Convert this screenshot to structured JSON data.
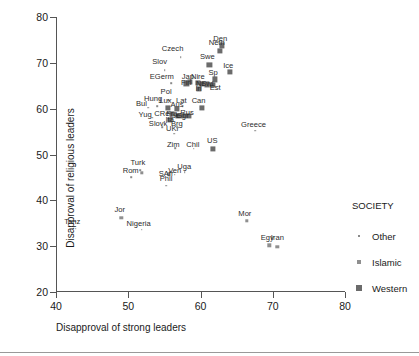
{
  "chart_data": {
    "type": "scatter",
    "title": "",
    "xlabel": "Disapproval of strong leaders",
    "ylabel": "Disapproval of religious leaders",
    "xlim": [
      40,
      80
    ],
    "ylim": [
      20,
      80
    ],
    "xticks": [
      40,
      50,
      60,
      70,
      80
    ],
    "yticks": [
      20,
      30,
      40,
      50,
      60,
      70,
      80
    ],
    "grid": false,
    "legend": {
      "title": "SOCIETY",
      "position": "right",
      "entries": [
        {
          "label": "Other",
          "marker": "tiny-dot",
          "color": "#8a8a8a"
        },
        {
          "label": "Islamic",
          "marker": "small-square",
          "color": "#8f8f8f"
        },
        {
          "label": "Western",
          "marker": "large-square",
          "color": "#6b6b6b"
        }
      ]
    },
    "series": [
      {
        "name": "Other",
        "marker": "tiny-dot",
        "points": [
          {
            "label": "Czech",
            "x": 57.1,
            "y": 71.2,
            "lx": 56.0,
            "ly": 73.0
          },
          {
            "label": "Slov",
            "x": 54.9,
            "y": 68.4,
            "lx": 54.2,
            "ly": 70.1
          },
          {
            "label": "EGerm",
            "x": 55.8,
            "y": 65.6,
            "lx": 54.5,
            "ly": 67.0
          },
          {
            "label": "Pol",
            "x": 55.4,
            "y": 61.9,
            "lx": 55.1,
            "ly": 63.6
          },
          {
            "label": "Hung",
            "x": 53.9,
            "y": 60.6,
            "lx": 53.3,
            "ly": 62.1
          },
          {
            "label": "Bul",
            "x": 52.6,
            "y": 60.2,
            "lx": 51.7,
            "ly": 61.0
          },
          {
            "label": "Yug",
            "x": 53.2,
            "y": 58.0,
            "lx": 52.2,
            "ly": 58.6
          },
          {
            "label": "Slovk",
            "x": 54.6,
            "y": 56.0,
            "lx": 54.0,
            "ly": 56.7
          },
          {
            "label": "UKr",
            "x": 56.2,
            "y": 54.5,
            "lx": 56.0,
            "ly": 55.5
          },
          {
            "label": "Brg",
            "x": 56.6,
            "y": 56.0,
            "lx": 56.6,
            "ly": 56.7
          },
          {
            "label": "CRep",
            "x": 55.4,
            "y": 59.1,
            "lx": 54.8,
            "ly": 58.9
          },
          {
            "label": "Zim",
            "x": 56.4,
            "y": 51.4,
            "lx": 56.1,
            "ly": 52.1
          },
          {
            "label": "Chil",
            "x": 58.9,
            "y": 51.3,
            "lx": 58.8,
            "ly": 52.1
          },
          {
            "label": "Greece",
            "x": 67.4,
            "y": 55.2,
            "lx": 67.2,
            "ly": 56.4
          },
          {
            "label": "Turk",
            "x": 51.5,
            "y": 46.6,
            "lx": 51.2,
            "ly": 48.1
          },
          {
            "label": "Rom",
            "x": 50.3,
            "y": 45.0,
            "lx": 50.2,
            "ly": 46.4
          },
          {
            "label": "Phil",
            "x": 55.1,
            "y": 43.2,
            "lx": 55.1,
            "ly": 44.6
          },
          {
            "label": "Ven",
            "x": 56.3,
            "y": 45.6,
            "lx": 56.3,
            "ly": 46.5
          },
          {
            "label": "Uga",
            "x": 57.7,
            "y": 46.1,
            "lx": 57.6,
            "ly": 47.3
          },
          {
            "label": "Nigeria",
            "x": 51.7,
            "y": 33.6,
            "lx": 51.3,
            "ly": 34.9
          },
          {
            "label": "Tanz",
            "x": 42.6,
            "y": 33.8,
            "lx": 42.1,
            "ly": 35.3
          },
          {
            "label": "Lat",
            "x": 57.4,
            "y": 60.4,
            "lx": 57.2,
            "ly": 61.7
          },
          {
            "label": "Can",
            "x": 59.9,
            "y": 60.3,
            "lx": 59.6,
            "ly": 61.6
          },
          {
            "label": "Sp",
            "x": 61.9,
            "y": 66.4,
            "lx": 61.6,
            "ly": 67.7
          }
        ]
      },
      {
        "name": "Islamic",
        "marker": "small-square",
        "points": [
          {
            "label": "Jor",
            "x": 48.9,
            "y": 36.2,
            "lx": 48.7,
            "ly": 37.8
          },
          {
            "label": "Mor",
            "x": 66.3,
            "y": 35.6,
            "lx": 66.0,
            "ly": 37.1
          },
          {
            "label": "Egy",
            "x": 69.4,
            "y": 30.2,
            "lx": 69.1,
            "ly": 31.7
          },
          {
            "label": "Iran",
            "x": 70.5,
            "y": 29.9,
            "lx": 70.5,
            "ly": 31.7
          },
          {
            "label": "SAfr",
            "x": 55.5,
            "y": 45.7,
            "lx": 55.1,
            "ly": 45.8
          },
          {
            "label": "Turk2",
            "x": 51.7,
            "y": 46.0,
            "lx": 51.7,
            "ly": 46.0
          }
        ]
      },
      {
        "name": "Western",
        "marker": "large-square",
        "points": [
          {
            "label": "Den",
            "x": 62.8,
            "y": 73.8,
            "lx": 62.6,
            "ly": 75.2
          },
          {
            "label": "Neth",
            "x": 62.5,
            "y": 72.6,
            "lx": 62.1,
            "ly": 74.3
          },
          {
            "label": "Swe",
            "x": 61.1,
            "y": 69.6,
            "lx": 60.8,
            "ly": 71.3
          },
          {
            "label": "Ice",
            "x": 63.9,
            "y": 68.0,
            "lx": 63.7,
            "ly": 69.4
          },
          {
            "label": "Nire",
            "x": 59.5,
            "y": 65.7,
            "lx": 59.5,
            "ly": 67.0
          },
          {
            "label": "Jap",
            "x": 58.4,
            "y": 65.8,
            "lx": 58.1,
            "ly": 67.0
          },
          {
            "label": "Est",
            "x": 61.5,
            "y": 65.2,
            "lx": 61.9,
            "ly": 64.5
          },
          {
            "label": "Fin",
            "x": 57.9,
            "y": 65.5,
            "lx": 57.9,
            "ly": 65.5
          },
          {
            "label": "Nor",
            "x": 60.1,
            "y": 65.4,
            "lx": 60.1,
            "ly": 65.4
          },
          {
            "label": "Irl",
            "x": 59.6,
            "y": 64.3,
            "lx": 59.6,
            "ly": 64.3
          },
          {
            "label": "Can2",
            "x": 60.1,
            "y": 60.2,
            "lx": 60.1,
            "ly": 60.2
          },
          {
            "label": "Lux",
            "x": 55.4,
            "y": 60.2,
            "lx": 55.0,
            "ly": 61.6
          },
          {
            "label": "Aus",
            "x": 56.6,
            "y": 59.9,
            "lx": 56.6,
            "ly": 60.8
          },
          {
            "label": "Belg",
            "x": 56.7,
            "y": 58.4,
            "lx": 56.8,
            "ly": 58.3
          },
          {
            "label": "Rus",
            "x": 58.2,
            "y": 58.5,
            "lx": 58.0,
            "ly": 59.1
          },
          {
            "label": "Ita",
            "x": 55.6,
            "y": 57.6,
            "lx": 55.6,
            "ly": 57.6
          },
          {
            "label": "Fra",
            "x": 55.9,
            "y": 58.8,
            "lx": 55.9,
            "ly": 58.8
          },
          {
            "label": "Gbr",
            "x": 57.4,
            "y": 58.5,
            "lx": 57.4,
            "ly": 58.5
          },
          {
            "label": "US",
            "x": 61.6,
            "y": 51.2,
            "lx": 61.5,
            "ly": 53.0
          },
          {
            "label": "Sp2",
            "x": 61.9,
            "y": 66.4,
            "lx": 61.9,
            "ly": 66.4
          },
          {
            "label": "Swi",
            "x": 60.8,
            "y": 65.3,
            "lx": 60.8,
            "ly": 65.3
          }
        ]
      }
    ]
  }
}
